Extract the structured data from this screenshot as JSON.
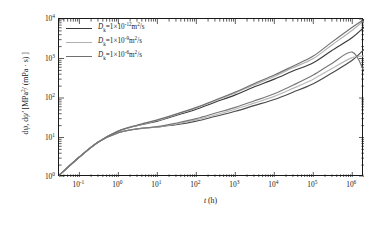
{
  "chart_data": {
    "type": "line",
    "title": "",
    "xlabel": "t (h)",
    "ylabel": "dψ, dψ′ [MPa²/(mPa·s)]",
    "xscale": "log",
    "yscale": "log",
    "xlim": [
      0.03,
      2000000
    ],
    "ylim": [
      1,
      10000
    ],
    "grid": false,
    "legend_position": "upper-left",
    "xticks": [
      "10-1",
      "100",
      "101",
      "102",
      "103",
      "104",
      "105",
      "106"
    ],
    "xtick_exponents": [
      -1,
      0,
      1,
      2,
      3,
      4,
      5,
      6
    ],
    "ytick_exponents": [
      0,
      1,
      2,
      3,
      4
    ],
    "series": [
      {
        "name": "dpsi, Dk=1e-12 m2/s",
        "legend_index": 0,
        "color": "#3a3a3a",
        "x": [
          0.03,
          0.1,
          0.3,
          1,
          3,
          10,
          30,
          100,
          300,
          1000,
          3000,
          10000,
          30000,
          100000,
          300000,
          1000000,
          2000000
        ],
        "y": [
          1.1,
          3.2,
          7.6,
          14.5,
          20,
          26,
          36,
          52,
          78,
          120,
          190,
          300,
          480,
          780,
          1600,
          3400,
          6200
        ]
      },
      {
        "name": "dpsi-deriv, Dk=1e-12 m2/s",
        "legend_index": 0,
        "color": "#4a4a4a",
        "x": [
          0.03,
          0.1,
          0.3,
          1,
          3,
          10,
          30,
          100,
          300,
          1000,
          3000,
          10000,
          30000,
          100000,
          300000,
          1000000,
          2000000
        ],
        "y": [
          1.1,
          3.2,
          7.6,
          13.2,
          16.5,
          18.5,
          21,
          26,
          34,
          46,
          64,
          92,
          140,
          230,
          430,
          900,
          1700
        ]
      },
      {
        "name": "dpsi, Dk=1e-9 m2/s",
        "legend_index": 1,
        "color": "#b0b0b0",
        "x": [
          0.03,
          0.1,
          0.3,
          1,
          3,
          10,
          30,
          100,
          300,
          1000,
          3000,
          10000,
          30000,
          100000,
          300000,
          1000000,
          2000000
        ],
        "y": [
          1.1,
          3.2,
          7.6,
          14.5,
          20,
          27,
          38,
          56,
          85,
          135,
          215,
          350,
          580,
          1000,
          2200,
          5200,
          9200
        ]
      },
      {
        "name": "dpsi-deriv, Dk=1e-9 m2/s",
        "legend_index": 1,
        "color": "#b8b8b8",
        "x": [
          0.03,
          0.1,
          0.3,
          1,
          3,
          10,
          30,
          100,
          300,
          1000,
          3000,
          10000,
          30000,
          100000,
          300000,
          1000000,
          2000000
        ],
        "y": [
          1.1,
          3.2,
          7.6,
          13.2,
          16.5,
          18.5,
          22,
          28,
          37,
          52,
          74,
          110,
          175,
          300,
          560,
          1050,
          1150
        ]
      },
      {
        "name": "dpsi, Dk=1e-6 m2/s",
        "legend_index": 2,
        "color": "#707070",
        "x": [
          0.03,
          0.1,
          0.3,
          1,
          3,
          10,
          30,
          100,
          300,
          1000,
          3000,
          10000,
          30000,
          100000,
          300000,
          1000000,
          2000000
        ],
        "y": [
          1.1,
          3.2,
          7.6,
          14.5,
          20.5,
          28,
          39,
          58,
          88,
          142,
          230,
          380,
          640,
          1150,
          2600,
          6200,
          9800
        ]
      },
      {
        "name": "dpsi-deriv, Dk=1e-6 m2/s",
        "legend_index": 2,
        "color": "#787878",
        "x": [
          0.03,
          0.1,
          0.3,
          1,
          3,
          10,
          30,
          100,
          300,
          1000,
          3000,
          10000,
          30000,
          100000,
          300000,
          1000000,
          2000000
        ],
        "y": [
          1.1,
          3.2,
          7.6,
          13.2,
          16.5,
          18.8,
          23,
          30,
          41,
          58,
          84,
          128,
          210,
          380,
          750,
          1450,
          480
        ]
      }
    ]
  },
  "legend": {
    "entries": [
      {
        "prefix": "D",
        "sub": "k",
        "eq": "=1×10",
        "exp": "-12",
        "unit": "m",
        "unit_exp": "2",
        "unit_tail": "/s",
        "color": "#3a3a3a"
      },
      {
        "prefix": "D",
        "sub": "k",
        "eq": "=1×10",
        "exp": "-9",
        "unit": "m",
        "unit_exp": "2",
        "unit_tail": "/s",
        "color": "#b0b0b0"
      },
      {
        "prefix": "D",
        "sub": "k",
        "eq": "=1×10",
        "exp": "-6",
        "unit": "m",
        "unit_exp": "2",
        "unit_tail": "/s",
        "color": "#707070"
      }
    ]
  },
  "axes": {
    "x_title_var": "t",
    "x_title_unit": "(h)",
    "y_title_head": "d",
    "y_title_psi1": "ψ",
    "y_title_mid": ", d",
    "y_title_psi2": "ψ′",
    "y_title_tail": "[MPa",
    "y_title_sup": "2",
    "y_title_end": "/ (mPa · s) ]"
  }
}
